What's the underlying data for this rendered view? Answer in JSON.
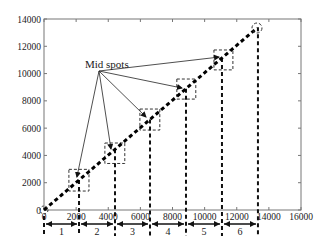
{
  "chart_data": {
    "type": "line",
    "title": "",
    "xlabel": "",
    "ylabel": "",
    "xlim": [
      0,
      16000
    ],
    "ylim": [
      0,
      14000
    ],
    "grid": false,
    "legend": null,
    "x_ticks": [
      0,
      2000,
      4000,
      6000,
      8000,
      10000,
      12000,
      14000,
      16000
    ],
    "y_ticks": [
      0,
      2000,
      4000,
      6000,
      8000,
      10000,
      12000,
      14000
    ],
    "x_tick_labels": [
      "0",
      "2000",
      "4000",
      "6000",
      "8000",
      "10000",
      "12000",
      "14000",
      "16000"
    ],
    "y_tick_labels": [
      "0",
      "2000",
      "4000",
      "6000",
      "8000",
      "10000",
      "12000",
      "14000"
    ],
    "series": [
      {
        "name": "diagonal path",
        "style": "thick dashed black",
        "x": [
          0,
          13260
        ],
        "y": [
          0,
          13340
        ]
      }
    ],
    "segment_boundaries_x": [
      0,
      2180,
      4420,
      6600,
      8840,
      11080,
      13320
    ],
    "segments": [
      {
        "label": "1",
        "from": 0,
        "to": 2180
      },
      {
        "label": "2",
        "from": 2180,
        "to": 4420
      },
      {
        "label": "3",
        "from": 4420,
        "to": 6600
      },
      {
        "label": "4",
        "from": 6600,
        "to": 8840
      },
      {
        "label": "5",
        "from": 8840,
        "to": 11080
      },
      {
        "label": "6",
        "from": 11080,
        "to": 13320
      }
    ],
    "mid_spots": [
      {
        "x": 2050,
        "y": 2420
      },
      {
        "x": 4170,
        "y": 4470
      },
      {
        "x": 6350,
        "y": 6820
      },
      {
        "x": 8590,
        "y": 8940
      },
      {
        "x": 10900,
        "y": 11210
      }
    ],
    "boxes": [
      {
        "x0": 1550,
        "x1": 2800,
        "y0": 1390,
        "y1": 2980
      },
      {
        "x0": 3790,
        "x1": 5030,
        "y0": 3410,
        "y1": 4910
      },
      {
        "x0": 5970,
        "x1": 7210,
        "y0": 5860,
        "y1": 7400
      },
      {
        "x0": 8270,
        "x1": 9450,
        "y0": 8130,
        "y1": 9600
      },
      {
        "x0": 10580,
        "x1": 11760,
        "y0": 10270,
        "y1": 11730
      }
    ],
    "endpoint_circle": {
      "x": 13260,
      "y": 13340
    },
    "origin_circle": {
      "x": 0,
      "y": 0
    },
    "annotations": [
      {
        "text": "Mid spots",
        "x": 3500,
        "y": 10000,
        "arrows_to": "mid_spots"
      }
    ]
  }
}
